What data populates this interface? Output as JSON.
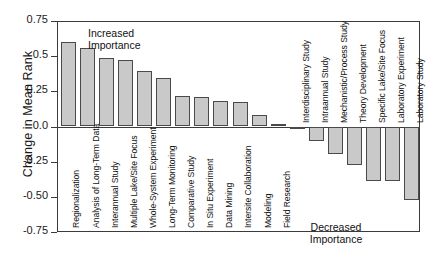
{
  "chart_data": {
    "type": "bar",
    "title": "",
    "xlabel": "",
    "ylabel": "Change in Mean Rank",
    "ylim": [
      -0.75,
      0.75
    ],
    "grid": false,
    "legend": null,
    "orientation": "vertical",
    "bar_color": "#c9c9c9",
    "bar_edge_color": "#4a4a4a",
    "ytick_labels": [
      "0.75",
      "0.5",
      "0.25",
      "0.0",
      "-0.25",
      "-0.50",
      "-0.75"
    ],
    "ytick_values": [
      0.75,
      0.5,
      0.25,
      0.0,
      -0.25,
      -0.5,
      -0.75
    ],
    "categories": [
      "Regionalization",
      "Analysis of Long-Term Data",
      "Interannual Study",
      "Multiple Lake/Site Focus",
      "Whole-System Experiment",
      "Long-Term Monitoring",
      "Comparative Study",
      "In Situ Experiment",
      "Data Mining",
      "Intersite Collaboration",
      "Modeling",
      "Field Research",
      "Interdisciplinary Study",
      "Intraannual Study",
      "Mechanistic/Process Study",
      "Theory Development",
      "Specific Lake/Site Focus",
      "Laboratory Experiment",
      "Laboratory Study"
    ],
    "values": [
      0.6,
      0.555,
      0.49,
      0.475,
      0.395,
      0.345,
      0.22,
      0.21,
      0.18,
      0.175,
      0.085,
      0.015,
      -0.005,
      -0.105,
      -0.195,
      -0.275,
      -0.385,
      -0.385,
      -0.525
    ],
    "annotations": [
      {
        "id": "increased",
        "line1": "Increased",
        "line2": "Importance",
        "position": "upper-left"
      },
      {
        "id": "decreased",
        "line1": "Decreased",
        "line2": "Importance",
        "position": "lower-right"
      }
    ]
  }
}
